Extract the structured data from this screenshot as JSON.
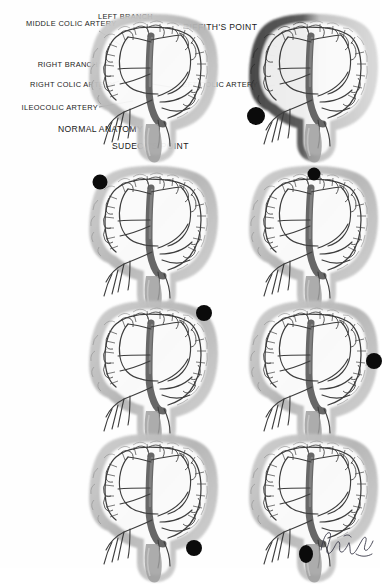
{
  "figure": {
    "panel_count": 8,
    "rows": 4,
    "columns": 2,
    "background_color": "#ffffff",
    "ink_color": "#1a1a1a",
    "colon_fill": "#b9b9b9",
    "colon_fill_dark": "#4a4a4a",
    "vessel_color": "#3d3d3d",
    "occlusion_dot_color": "#0b0b0b"
  },
  "labels": {
    "middle_colic_artery": "Middle colic artery",
    "left_branch": "Left branch",
    "right_branch": "Right branch",
    "right_colic_artery": "Right colic artery",
    "ileocolic_artery": "Ileocolic artery",
    "left_colic_artery": "Left colic artery",
    "griffiths_point": "Griffith's point",
    "sudecks_point": "Sudeck's point",
    "normal_anatomy": "Normal anatomy"
  },
  "panels": [
    {
      "index": 1,
      "name": "normal-anatomy",
      "caption": "Normal anatomy",
      "occlusion_dot": null,
      "ischemic_shading": false,
      "annotated": true
    },
    {
      "index": 2,
      "name": "ileocolic-occlusion",
      "caption": "",
      "occlusion_dot": {
        "region": "ileocolic / right lower",
        "x": 18,
        "y": 104
      },
      "ischemic_shading": true,
      "shaded_region": "ascending and proximal transverse colon",
      "annotated": false
    },
    {
      "index": 3,
      "name": "hepatic-flexure-occlusion",
      "caption": "",
      "occlusion_dot": {
        "region": "hepatic flexure / upper left",
        "x": 22,
        "y": 18
      },
      "ischemic_shading": false,
      "annotated": false
    },
    {
      "index": 4,
      "name": "transverse-colon-occlusion",
      "caption": "",
      "occlusion_dot": {
        "region": "mid transverse colon / top centre",
        "x": 76,
        "y": 10
      },
      "ischemic_shading": false,
      "annotated": false
    },
    {
      "index": 5,
      "name": "splenic-flexure-occlusion",
      "caption": "",
      "occlusion_dot": {
        "region": "splenic flexure / Griffith's point",
        "x": 126,
        "y": 14
      },
      "ischemic_shading": false,
      "annotated": false
    },
    {
      "index": 6,
      "name": "descending-colon-occlusion",
      "caption": "",
      "occlusion_dot": {
        "region": "descending colon / mid right",
        "x": 136,
        "y": 62
      },
      "ischemic_shading": false,
      "annotated": false
    },
    {
      "index": 7,
      "name": "sigmoid-colon-occlusion",
      "caption": "",
      "occlusion_dot": {
        "region": "sigmoid colon / lower right",
        "x": 116,
        "y": 116
      },
      "ischemic_shading": false,
      "annotated": false
    },
    {
      "index": 8,
      "name": "rectosigmoid-occlusion",
      "caption": "",
      "occlusion_dot": {
        "region": "rectosigmoid junction / bottom centre",
        "x": 68,
        "y": 122
      },
      "ischemic_shading": false,
      "annotated": false,
      "has_signature": true
    }
  ],
  "signature": {
    "present": true,
    "style": "cursive artist signature",
    "position": "bottom right"
  }
}
